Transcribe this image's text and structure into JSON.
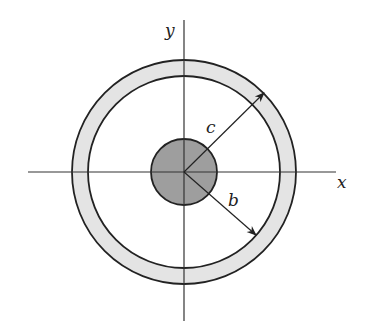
{
  "diagram": {
    "labels": {
      "x_axis": "x",
      "y_axis": "y",
      "radius_c": "c",
      "radius_b": "b"
    },
    "colors": {
      "stroke": "#222222",
      "inner_fill": "#9e9e9e",
      "shell_fill": "#e4e4e4",
      "background": "#ffffff"
    },
    "geometry": {
      "center": [
        184,
        172
      ],
      "inner_radius": 33,
      "shell_inner_radius": 96,
      "shell_outer_radius": 112
    }
  }
}
